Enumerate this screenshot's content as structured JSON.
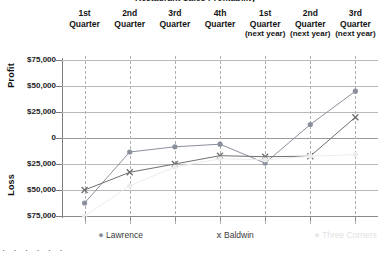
{
  "chart_data": {
    "type": "line",
    "title": "Restaurant Sales Profitability",
    "xlabel": "",
    "ylabel": "Profit / Loss",
    "ylim": [
      -75000,
      75000
    ],
    "grid": true,
    "legend_position": "bottom",
    "categories": [
      "1st Quarter",
      "2nd Quarter",
      "3rd Quarter",
      "4th Quarter",
      "1st Quarter (next year)",
      "2nd Quarter (next year)",
      "3rd Quarter (next year)"
    ],
    "category_lines": [
      [
        "1st",
        "Quarter",
        ""
      ],
      [
        "2nd",
        "Quarter",
        ""
      ],
      [
        "3rd",
        "Quarter",
        ""
      ],
      [
        "4th",
        "Quarter",
        ""
      ],
      [
        "1st",
        "Quarter",
        "(next year)"
      ],
      [
        "2nd",
        "Quarter",
        "(next year)"
      ],
      [
        "3rd",
        "Quarter",
        "(next year)"
      ]
    ],
    "ytick_labels": [
      "$75,000",
      "$50,000",
      "$25,000",
      "0",
      "$25,000",
      "$50,000",
      "$75,000"
    ],
    "ytick_values": [
      75000,
      50000,
      25000,
      0,
      -25000,
      -50000,
      -75000
    ],
    "axis_words": {
      "upper": "Profit",
      "lower": "Loss"
    },
    "series": [
      {
        "name": "Lawrence",
        "marker": "circle",
        "color": "#8a8f9c",
        "values": [
          -62500,
          -13500,
          -8500,
          -6000,
          -24000,
          13000,
          45000
        ]
      },
      {
        "name": "Baldwin",
        "marker": "x",
        "color": "#6f6f6f",
        "values": [
          -50000,
          -33000,
          -25000,
          -17000,
          -18000,
          -17500,
          20000
        ]
      },
      {
        "name": "Three Corners",
        "marker": "circle",
        "color": "#ededed",
        "values": [
          -75000,
          -46000,
          -28000,
          -20000,
          -21000,
          -17500,
          -16000
        ]
      }
    ]
  },
  "legend": {
    "items": [
      {
        "label": "Lawrence",
        "symbol": "●"
      },
      {
        "label": "Baldwin",
        "symbol": "x"
      },
      {
        "label": "Three Corners",
        "symbol": "●"
      }
    ]
  },
  "decor": {
    "bottom_dots": "· · · · · ·"
  }
}
